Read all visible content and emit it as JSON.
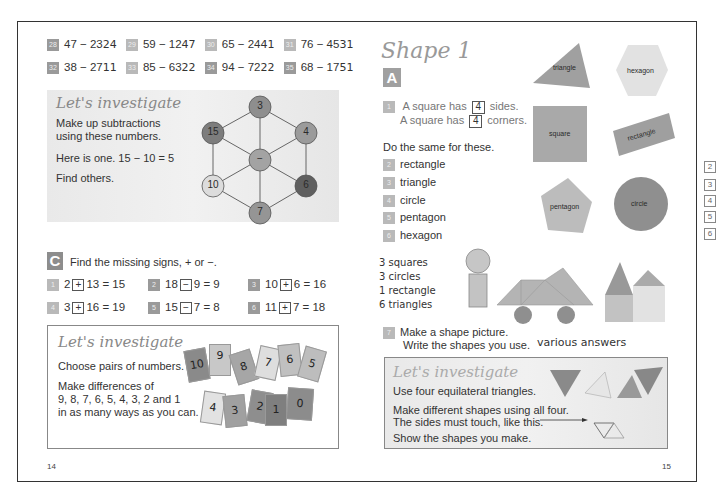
{
  "left_page": {
    "exercises_row1": [
      {
        "num": "28",
        "problem": "47 − 23",
        "answer": "24"
      },
      {
        "num": "29",
        "problem": "59 − 12",
        "answer": "47"
      },
      {
        "num": "30",
        "problem": "65 − 24",
        "answer": "41"
      },
      {
        "num": "31",
        "problem": "76 − 45",
        "answer": "31"
      }
    ],
    "exercises_row2": [
      {
        "num": "32",
        "problem": "38 − 27",
        "answer": "11"
      },
      {
        "num": "33",
        "problem": "85 − 63",
        "answer": "22"
      },
      {
        "num": "34",
        "problem": "94 − 72",
        "answer": "22"
      },
      {
        "num": "35",
        "problem": "68 − 17",
        "answer": "51"
      }
    ],
    "investigate1": {
      "title": "Let's investigate",
      "line1": "Make up subtractions",
      "line2": "using these numbers.",
      "line3": "Here is one. 15 − 10 = 5",
      "line4": "Find others.",
      "nodes": [
        {
          "label": "3",
          "color": "#8e8e8e"
        },
        {
          "label": "15",
          "color": "#7d7d7d"
        },
        {
          "label": "4",
          "color": "#9b9b9b"
        },
        {
          "label": "−",
          "color": "#a3a3a3"
        },
        {
          "label": "10",
          "color": "#dcdcdc"
        },
        {
          "label": "6",
          "color": "#5f5f5f"
        },
        {
          "label": "7",
          "color": "#959595"
        }
      ]
    },
    "section_c": {
      "letter": "C",
      "instruction": "Find the missing signs, + or −.",
      "items": [
        {
          "num": "1",
          "left": "2",
          "sign": "+",
          "right": "13 = 15"
        },
        {
          "num": "2",
          "left": "18",
          "sign": "−",
          "right": "9 = 9"
        },
        {
          "num": "3",
          "left": "10",
          "sign": "+",
          "right": "6 = 16"
        },
        {
          "num": "4",
          "left": "3",
          "sign": "+",
          "right": "16 = 19"
        },
        {
          "num": "5",
          "left": "15",
          "sign": "−",
          "right": "7 = 8"
        },
        {
          "num": "6",
          "left": "11",
          "sign": "+",
          "right": "7 = 18"
        }
      ]
    },
    "investigate2": {
      "title": "Let's investigate",
      "line1": "Choose pairs of numbers.",
      "line2": "Make differences of",
      "line3": "9, 8, 7, 6, 5, 4, 3, 2 and 1",
      "line4": "in as many ways as you can.",
      "cards_top": [
        "10",
        "9",
        "8",
        "7",
        "6",
        "5"
      ],
      "cards_bottom": [
        "4",
        "3",
        "2",
        "1",
        "0"
      ]
    },
    "page_number": "14"
  },
  "right_page": {
    "title": "Shape 1",
    "section_letter": "A",
    "q1_num": "1",
    "q1_line1_a": "A square has",
    "q1_line1_b": "sides.",
    "q1_line2_a": "A square has",
    "q1_line2_b": "corners.",
    "q1_answer": "4",
    "do_same": "Do the same for these.",
    "list": [
      {
        "num": "2",
        "label": "rectangle"
      },
      {
        "num": "3",
        "label": "triangle"
      },
      {
        "num": "4",
        "label": "circle"
      },
      {
        "num": "5",
        "label": "pentagon"
      },
      {
        "num": "6",
        "label": "hexagon"
      }
    ],
    "shapes": {
      "triangle": "triangle",
      "hexagon": "hexagon",
      "square": "square",
      "rectangle": "rectangle",
      "pentagon": "pentagon",
      "circle": "circle"
    },
    "handwritten": [
      "3 squares",
      "3 circles",
      "1 rectangle",
      "6 triangles"
    ],
    "q7_num": "7",
    "q7_line1": "Make a shape picture.",
    "q7_line2": "Write the shapes you use.",
    "q7_answer": "various answers",
    "investigate": {
      "title": "Let's investigate",
      "line1": "Use four equilateral triangles.",
      "line2": "Make different shapes using all four.",
      "line3": "The sides must touch, like this.",
      "line4": "Show the shapes you make."
    },
    "page_number": "15"
  },
  "margin_answers": [
    "2",
    "3",
    "4",
    "5",
    "6"
  ]
}
